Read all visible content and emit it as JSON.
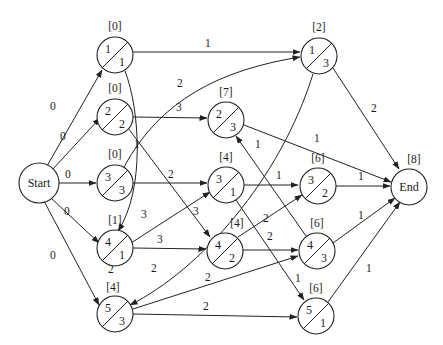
{
  "diagram": {
    "type": "activity-on-node network",
    "start": {
      "label": "Start"
    },
    "end": {
      "label": "End",
      "earliest": "[8]"
    },
    "nodes": [
      {
        "id": "A",
        "top": "1",
        "bottom": "1",
        "earliest": "[0]"
      },
      {
        "id": "B",
        "top": "2",
        "bottom": "2",
        "earliest": "[0]"
      },
      {
        "id": "C",
        "top": "3",
        "bottom": "3",
        "earliest": "[0]"
      },
      {
        "id": "D",
        "top": "4",
        "bottom": "1",
        "earliest": "[1]"
      },
      {
        "id": "E",
        "top": "5",
        "bottom": "3",
        "earliest": "[4]"
      },
      {
        "id": "F",
        "top": "2",
        "bottom": "3",
        "earliest": "[7]"
      },
      {
        "id": "G",
        "top": "3",
        "bottom": "1",
        "earliest": "[4]"
      },
      {
        "id": "H",
        "top": "4",
        "bottom": "2",
        "earliest": "[4]"
      },
      {
        "id": "I",
        "top": "1",
        "bottom": "3",
        "earliest": "[2]"
      },
      {
        "id": "J",
        "top": "3",
        "bottom": "2",
        "earliest": "[6]"
      },
      {
        "id": "K",
        "top": "4",
        "bottom": "3",
        "earliest": "[6]"
      },
      {
        "id": "L",
        "top": "5",
        "bottom": "1",
        "earliest": "[6]"
      }
    ],
    "edges": [
      {
        "from": "Start",
        "to": "A",
        "weight": "0"
      },
      {
        "from": "Start",
        "to": "B",
        "weight": "0"
      },
      {
        "from": "Start",
        "to": "C",
        "weight": "0"
      },
      {
        "from": "Start",
        "to": "D",
        "weight": "0"
      },
      {
        "from": "Start",
        "to": "E",
        "weight": "0"
      },
      {
        "from": "A",
        "to": "I",
        "weight": "1"
      },
      {
        "from": "A",
        "to": "D",
        "weight": "1"
      },
      {
        "from": "B",
        "to": "F",
        "weight": "3"
      },
      {
        "from": "B",
        "to": "H",
        "weight": "3"
      },
      {
        "from": "C",
        "to": "I",
        "weight": "2"
      },
      {
        "from": "C",
        "to": "G",
        "weight": "2"
      },
      {
        "from": "D",
        "to": "G",
        "weight": "3"
      },
      {
        "from": "D",
        "to": "H",
        "weight": "3"
      },
      {
        "from": "D",
        "to": "E",
        "weight": "2"
      },
      {
        "from": "E",
        "to": "K",
        "weight": "2"
      },
      {
        "from": "E",
        "to": "L",
        "weight": "2"
      },
      {
        "from": "I",
        "to": "E",
        "weight": "2"
      },
      {
        "from": "I",
        "to": "End",
        "weight": "2"
      },
      {
        "from": "F",
        "to": "End",
        "weight": "1"
      },
      {
        "from": "G",
        "to": "J",
        "weight": "1"
      },
      {
        "from": "G",
        "to": "L",
        "weight": "1"
      },
      {
        "from": "H",
        "to": "J",
        "weight": "2"
      },
      {
        "from": "H",
        "to": "K",
        "weight": "2"
      },
      {
        "from": "K",
        "to": "F",
        "weight": "1"
      },
      {
        "from": "J",
        "to": "End",
        "weight": "1"
      },
      {
        "from": "K",
        "to": "End",
        "weight": "1"
      },
      {
        "from": "L",
        "to": "End",
        "weight": "1"
      }
    ]
  }
}
